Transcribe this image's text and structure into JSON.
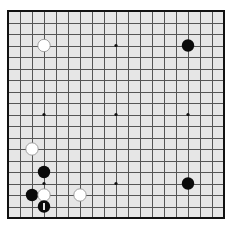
{
  "board": {
    "size": 19,
    "origin_x": 8,
    "origin_y": 11,
    "spacing_x": 12,
    "spacing_y": 11.5,
    "stone_radius": 6.2,
    "colors": {
      "background": "#e6e6e6",
      "grid": "#555555",
      "border": "#111111",
      "black_stone": "#0a0a0a",
      "white_stone": "#ffffff",
      "white_outline": "#8a8a8a",
      "last_move_marker": "#ffffff"
    },
    "star_points": [
      [
        3,
        3
      ],
      [
        9,
        3
      ],
      [
        15,
        3
      ],
      [
        3,
        9
      ],
      [
        9,
        9
      ],
      [
        15,
        9
      ],
      [
        3,
        15
      ],
      [
        9,
        15
      ],
      [
        15,
        15
      ]
    ],
    "stones": [
      {
        "color": "white",
        "col": 3,
        "row": 3
      },
      {
        "color": "black",
        "col": 15,
        "row": 3
      },
      {
        "color": "white",
        "col": 2,
        "row": 12
      },
      {
        "color": "black",
        "col": 3,
        "row": 14
      },
      {
        "color": "black",
        "col": 15,
        "row": 15
      },
      {
        "color": "black",
        "col": 2,
        "row": 16
      },
      {
        "color": "white",
        "col": 3,
        "row": 16
      },
      {
        "color": "white",
        "col": 6,
        "row": 16
      },
      {
        "color": "black",
        "col": 3,
        "row": 17,
        "last_move": true
      }
    ]
  }
}
